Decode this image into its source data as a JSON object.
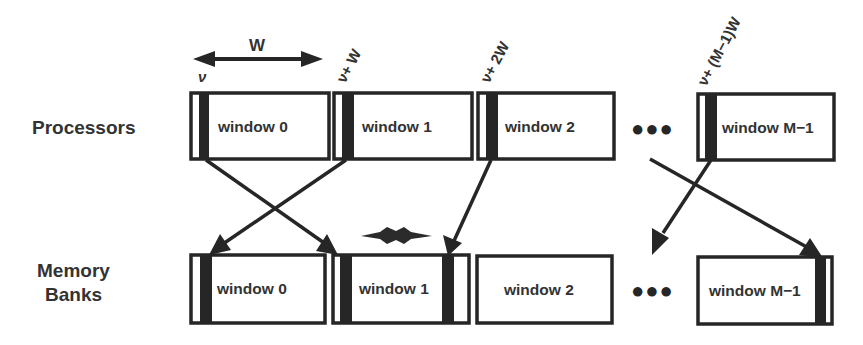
{
  "rows": {
    "processors": "Processors",
    "memory_line1": "Memory",
    "memory_line2": "Banks"
  },
  "width_marker": {
    "label": "W"
  },
  "address_labels": {
    "a0": "ν",
    "a1": "ν+ W",
    "a2": "ν+ 2W",
    "a3": "ν+ (M−1)W"
  },
  "processor_windows": [
    {
      "label": "window 0"
    },
    {
      "label": "window 1"
    },
    {
      "label": "window 2"
    },
    {
      "label": "window M−1"
    }
  ],
  "memory_windows": [
    {
      "label": "window 0"
    },
    {
      "label": "window 1"
    },
    {
      "label": "window 2"
    },
    {
      "label": "window M−1"
    }
  ],
  "ellipsis": "●●●",
  "conflict_marker": "star-burst",
  "colors": {
    "ink": "#262626",
    "text": "#333333",
    "background": "#ffffff"
  }
}
